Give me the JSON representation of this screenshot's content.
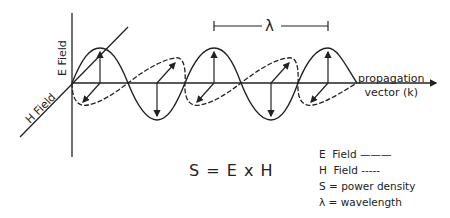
{
  "diagram": {
    "type": "electromagnetic wave",
    "axes": {
      "e_field_label": "E Field",
      "h_field_label": "H Field",
      "propagation_label_line1": "propagation",
      "propagation_label_line2": "vector (k)"
    },
    "wavelength_marker": "λ",
    "formula": "S = E x H",
    "legend": [
      {
        "symbol": "E",
        "text": "Field",
        "style_mark": "———"
      },
      {
        "symbol": "H",
        "text": "Field",
        "style_mark": "-----"
      },
      {
        "symbol": "S",
        "text": "= power density"
      },
      {
        "symbol": "λ",
        "text": "= wavelength"
      }
    ],
    "colors": {
      "ink": "#222222",
      "background": "#ffffff"
    }
  }
}
